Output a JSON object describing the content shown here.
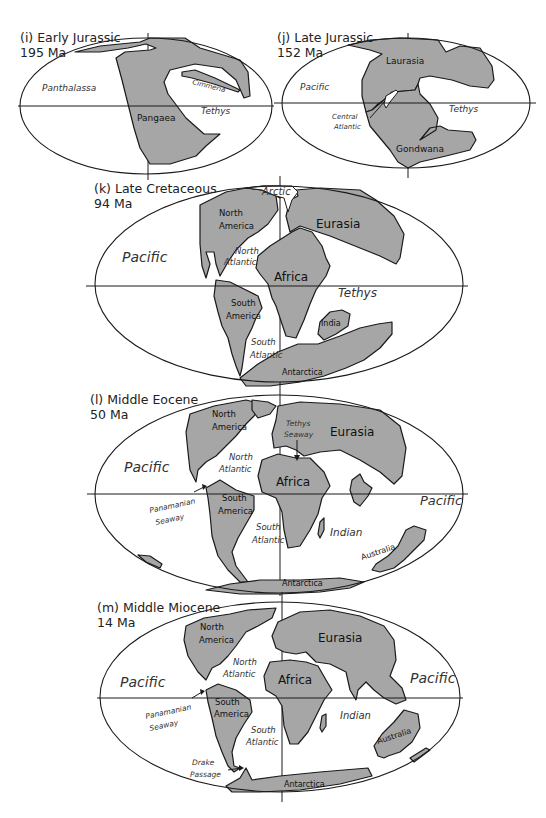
{
  "figure": {
    "colors": {
      "land": "#a6a6a6",
      "outline": "#1a1a1a",
      "ocean": "#ffffff",
      "text": "#222222"
    }
  },
  "panels": [
    {
      "id": "i",
      "title": "(i) Early Jurassic",
      "age": "195 Ma",
      "landmasses": [
        "Pangaea",
        "Cimmeria"
      ],
      "oceans": [
        "Panthalassa",
        "Tethys"
      ]
    },
    {
      "id": "j",
      "title": "(j) Late Jurassic",
      "age": "152 Ma",
      "landmasses": [
        "Laurasia",
        "Gondwana"
      ],
      "oceans": [
        "Pacific",
        "Tethys"
      ],
      "annotations": [
        "Central",
        "Atlantic"
      ]
    },
    {
      "id": "k",
      "title": "(k) Late Cretaceous",
      "age": "94 Ma",
      "landmasses": [
        "North",
        "America",
        "Eurasia",
        "Africa",
        "South",
        "America",
        "India",
        "Antarctica"
      ],
      "oceans": [
        "Arctic",
        "Pacific",
        "North",
        "Atlantic",
        "Tethys",
        "South",
        "Atlantic"
      ]
    },
    {
      "id": "l",
      "title": "(l) Middle Eocene",
      "age": "50 Ma",
      "landmasses": [
        "North",
        "America",
        "Eurasia",
        "Africa",
        "South",
        "America",
        "Australia",
        "Antarctica"
      ],
      "oceans": [
        "Pacific",
        "North",
        "Atlantic",
        "Pacific",
        "South",
        "Atlantic",
        "Indian"
      ],
      "annotations": [
        "Tethys",
        "Seaway",
        "Panamanian",
        "Seaway"
      ]
    },
    {
      "id": "m",
      "title": "(m) Middle Miocene",
      "age": "14 Ma",
      "landmasses": [
        "North",
        "America",
        "Eurasia",
        "Africa",
        "South",
        "America",
        "Australia",
        "Antarctica"
      ],
      "oceans": [
        "Pacific",
        "North",
        "Atlantic",
        "Pacific",
        "Indian",
        "South",
        "Atlantic"
      ],
      "annotations": [
        "Panamanian",
        "Seaway",
        "Drake",
        "Passage"
      ]
    }
  ]
}
